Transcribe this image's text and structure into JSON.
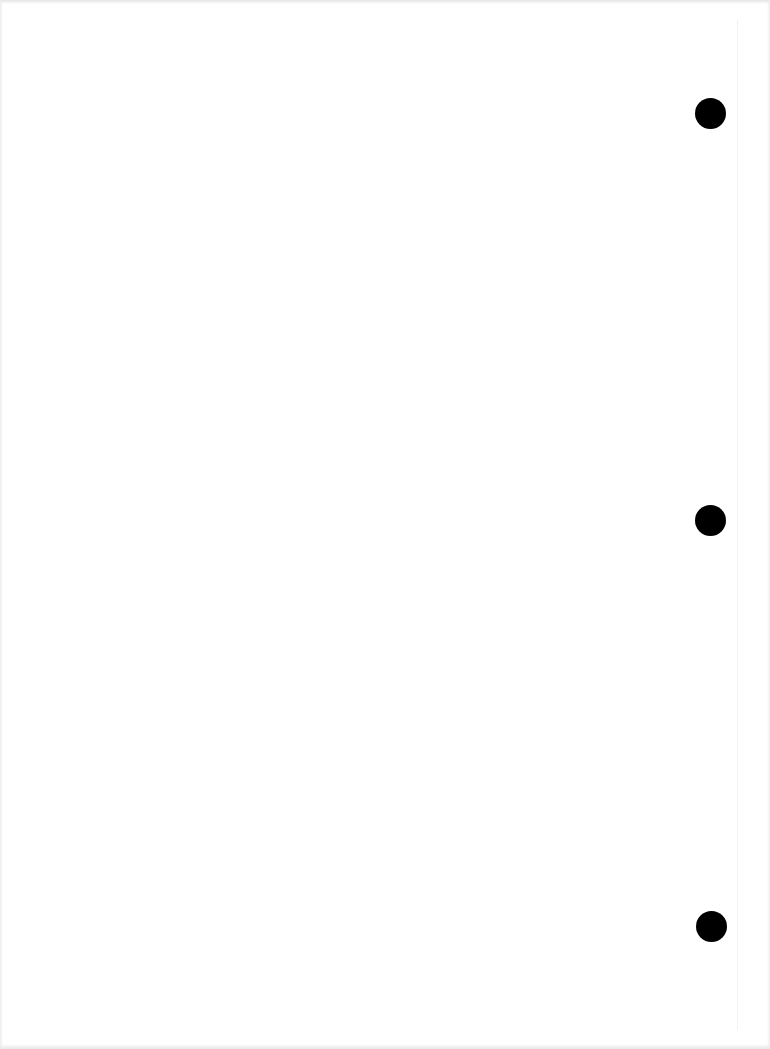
{
  "document": {
    "type": "blank scanned page",
    "background_color": "#ffffff",
    "text_content": ""
  },
  "punch_holes": [
    {
      "cx": 710,
      "cy": 113,
      "r": 15,
      "color": "#000000"
    },
    {
      "cx": 710,
      "cy": 520,
      "r": 15,
      "color": "#000000"
    },
    {
      "cx": 711,
      "cy": 926,
      "r": 15,
      "color": "#000000"
    }
  ]
}
